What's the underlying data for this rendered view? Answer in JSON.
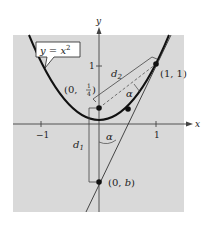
{
  "figure": {
    "background": "#ffffff",
    "panel_color": "#d9d9d9",
    "ink": "#1a1a1a",
    "axes": {
      "x_label": "x",
      "y_label": "y",
      "x_ticks": [
        {
          "value": -1,
          "label": "−1"
        },
        {
          "value": 1,
          "label": "1"
        }
      ],
      "y_ticks": [
        {
          "value": 1,
          "label": "1"
        }
      ]
    },
    "curve": {
      "equation_label": "y = x",
      "exponent": "2"
    },
    "points": {
      "focus": {
        "label_prefix": "(0, ",
        "num": "1",
        "den": "4",
        "label_suffix": ")"
      },
      "tangent_point": {
        "label": "(1, 1)"
      },
      "intercept": {
        "label_prefix": "(0, ",
        "var": "b",
        "label_suffix": ")"
      }
    },
    "annotations": {
      "d1": "d",
      "d1_sub": "1",
      "d2": "d",
      "d2_sub": "2",
      "alpha_upper": "α",
      "alpha_lower": "α"
    }
  }
}
